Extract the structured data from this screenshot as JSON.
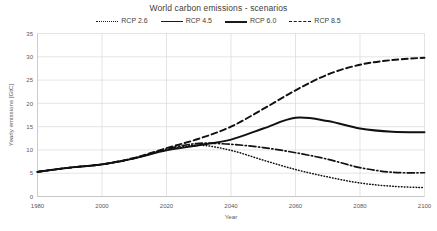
{
  "chart_data": {
    "type": "line",
    "title": "World carbon emissions - scenarios",
    "xlabel": "Year",
    "ylabel": "Yearly emissions [GtC]",
    "xlim": [
      1980,
      2100
    ],
    "ylim": [
      0,
      35
    ],
    "xticks": [
      1980,
      2000,
      2020,
      2040,
      2060,
      2080,
      2100
    ],
    "yticks": [
      0,
      5,
      10,
      15,
      20,
      25,
      30,
      35
    ],
    "grid": true,
    "legend_position": "top-center",
    "x": [
      1980,
      1990,
      2000,
      2010,
      2020,
      2030,
      2040,
      2050,
      2060,
      2070,
      2080,
      2090,
      2100
    ],
    "series": [
      {
        "name": "RCP 2.6",
        "style": "dotted",
        "color": "#111111",
        "values": [
          5.3,
          6.2,
          6.9,
          8.2,
          10.0,
          11.0,
          9.9,
          7.8,
          5.8,
          4.2,
          2.9,
          2.2,
          1.9
        ]
      },
      {
        "name": "RCP 4.5",
        "style": "solid",
        "color": "#111111",
        "values": [
          5.3,
          6.2,
          6.9,
          8.2,
          9.9,
          11.0,
          12.2,
          14.6,
          16.9,
          16.2,
          14.6,
          13.9,
          13.8
        ]
      },
      {
        "name": "RCP 6.0",
        "style": "dash-dot",
        "color": "#111111",
        "values": [
          5.3,
          6.2,
          6.9,
          8.2,
          10.2,
          11.4,
          11.2,
          10.5,
          9.4,
          8.0,
          6.2,
          5.2,
          5.1
        ]
      },
      {
        "name": "RCP 8.5",
        "style": "dashed",
        "color": "#111111",
        "values": [
          5.3,
          6.2,
          6.9,
          8.3,
          10.4,
          12.4,
          15.0,
          18.8,
          22.8,
          26.2,
          28.3,
          29.3,
          29.8
        ]
      }
    ]
  },
  "title": "World carbon emissions - scenarios",
  "legend": {
    "items": [
      {
        "label": "RCP 2.6"
      },
      {
        "label": "RCP 4.5"
      },
      {
        "label": "RCP 6.0"
      },
      {
        "label": "RCP 8.5"
      }
    ]
  },
  "axes": {
    "x_title": "Year",
    "y_title": "Yearly emissions [GtC]",
    "x_tick_labels": [
      "1980",
      "2000",
      "2020",
      "2040",
      "2060",
      "2080",
      "2100"
    ],
    "y_tick_labels": [
      "0",
      "5",
      "10",
      "15",
      "20",
      "25",
      "30",
      "35"
    ]
  }
}
